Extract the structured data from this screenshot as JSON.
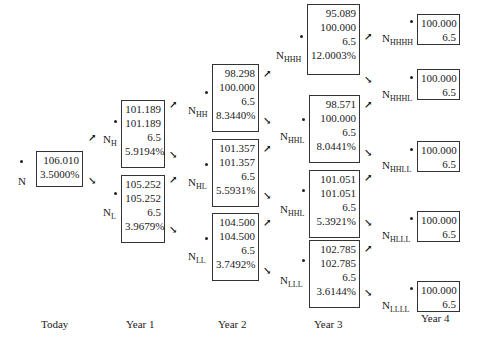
{
  "diagram": {
    "type": "binomial-interest-rate-tree",
    "columns": [
      "Today",
      "Year 1",
      "Year 2",
      "Year 3",
      "Year 4"
    ],
    "nodes": {
      "N": {
        "label_main": "N",
        "label_sub": "",
        "values": [
          "106.010",
          "3.5000%"
        ]
      },
      "NH": {
        "label_main": "N",
        "label_sub": "H",
        "values": [
          "101.189",
          "101.189",
          "6.5",
          "5.9194%"
        ]
      },
      "NL": {
        "label_main": "N",
        "label_sub": "L",
        "values": [
          "105.252",
          "105.252",
          "6.5",
          "3.9679%"
        ]
      },
      "NHH": {
        "label_main": "N",
        "label_sub": "HH",
        "values": [
          "98.298",
          "100.000",
          "6.5",
          "8.3440%"
        ]
      },
      "NHL": {
        "label_main": "N",
        "label_sub": "HL",
        "values": [
          "101.357",
          "101.357",
          "6.5",
          "5.5931%"
        ]
      },
      "NLL": {
        "label_main": "N",
        "label_sub": "LL",
        "values": [
          "104.500",
          "104.500",
          "6.5",
          "3.7492%"
        ]
      },
      "NHHH": {
        "label_main": "N",
        "label_sub": "HHH",
        "values": [
          "95.089",
          "100.000",
          "6.5",
          "12.0003%"
        ]
      },
      "NHHL": {
        "label_main": "N",
        "label_sub": "HHL",
        "values": [
          "98.571",
          "100.000",
          "6.5",
          "8.0441%"
        ]
      },
      "NHHL2": {
        "label_main": "N",
        "label_sub": "HHL",
        "values": [
          "101.051",
          "101.051",
          "6.5",
          "5.3921%"
        ]
      },
      "NLLL": {
        "label_main": "N",
        "label_sub": "LLL",
        "values": [
          "102.785",
          "102.785",
          "6.5",
          "3.6144%"
        ]
      },
      "NHHHH": {
        "label_main": "N",
        "label_sub": "HHHH",
        "values": [
          "100.000",
          "6.5"
        ]
      },
      "NHHHL": {
        "label_main": "N",
        "label_sub": "HHHL",
        "values": [
          "100.000",
          "6.5"
        ]
      },
      "NHHLL": {
        "label_main": "N",
        "label_sub": "HHLL",
        "values": [
          "100.000",
          "6.5"
        ]
      },
      "NHLLL": {
        "label_main": "N",
        "label_sub": "HLLL",
        "values": [
          "100.000",
          "6.5"
        ]
      },
      "NLLLL": {
        "label_main": "N",
        "label_sub": "LLLL",
        "values": [
          "100.000",
          "6.5"
        ]
      }
    },
    "arrows": {
      "up": "↗",
      "down": "↘"
    }
  }
}
